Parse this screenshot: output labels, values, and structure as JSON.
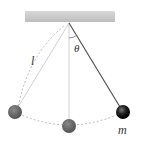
{
  "diagram": {
    "type": "simple-pendulum",
    "labels": {
      "length": "l",
      "angle": "θ",
      "mass": "m"
    },
    "colors": {
      "support": "#c8c8c8",
      "string": "#555555",
      "string_faint": "#cfcfcf",
      "ball_dark": "#111111",
      "ball_grey": "#6a6a6a",
      "path": "#bbbbbb"
    }
  }
}
